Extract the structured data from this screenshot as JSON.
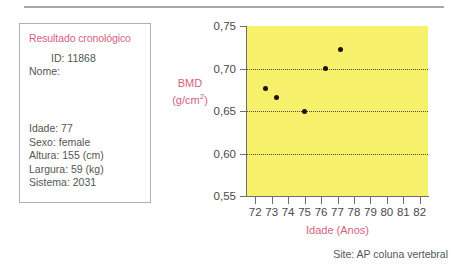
{
  "info_panel": {
    "title": "Resultado cronológico",
    "id_line": "ID: 11868",
    "nome_line": "Nome:",
    "fields": [
      "Idade: 77",
      "Sexo: female",
      "Altura: 155 (cm)",
      "Largura: 59 (kg)",
      "Sistema: 2031"
    ]
  },
  "footer": {
    "site_note": "Site: AP coluna vertebral"
  },
  "colors": {
    "accent_pink": "#d4627f",
    "plot_background": "#f7f06a",
    "point_color": "#1c1008",
    "text_gray": "#555555",
    "axis_gray": "#6e6e6e"
  },
  "chart_data": {
    "type": "scatter",
    "title": "",
    "xlabel": "Idade (Anos)",
    "ylabel": "BMD (g/cm²)",
    "ylabel_line1": "BMD",
    "ylabel_line2": "(g/cm",
    "ylabel_exp": "2",
    "ylabel_line2_end": ")",
    "xlim": [
      71.5,
      82.5
    ],
    "ylim": [
      0.55,
      0.75
    ],
    "xticks": [
      72,
      73,
      74,
      75,
      76,
      77,
      78,
      79,
      80,
      81,
      82
    ],
    "xticklabels": [
      "72",
      "73",
      "74",
      "75",
      "76",
      "77",
      "78",
      "79",
      "80",
      "81",
      "82"
    ],
    "yticks": [
      0.55,
      0.6,
      0.65,
      0.7,
      0.75
    ],
    "yticklabels": [
      "0,55",
      "0,60",
      "0,65",
      "0,70",
      "0,75"
    ],
    "gridlines_y": [
      0.6,
      0.65,
      0.7
    ],
    "grid": true,
    "legend": "none",
    "points": [
      {
        "x": 72.6,
        "y": 0.676
      },
      {
        "x": 73.3,
        "y": 0.666
      },
      {
        "x": 75.0,
        "y": 0.65
      },
      {
        "x": 76.3,
        "y": 0.7
      },
      {
        "x": 77.2,
        "y": 0.722
      }
    ]
  }
}
